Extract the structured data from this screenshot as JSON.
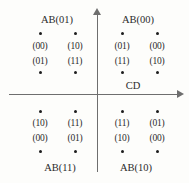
{
  "figure": {
    "type": "constellation-diagram",
    "axis_label_horizontal": "CD",
    "background_color": "#fdfdfb",
    "axis_color": "#6e6e6e",
    "point_color": "#1d1d1d"
  },
  "quadrants": [
    {
      "name": "top-left",
      "label": "AB(01)",
      "label_x": 57,
      "label_y": 14,
      "points": [
        {
          "dot_x": 40,
          "dot_y": 33,
          "upper": "(00)",
          "lower": "(01)",
          "upper_y": 41,
          "lower_y": 56
        },
        {
          "dot_x": 75,
          "dot_y": 33,
          "upper": "(10)",
          "lower": "(11)",
          "upper_y": 41,
          "lower_y": 56
        },
        {
          "dot_x": 40,
          "dot_y": 72,
          "upper": "",
          "lower": "",
          "upper_y": 0,
          "lower_y": 0
        },
        {
          "dot_x": 75,
          "dot_y": 72,
          "upper": "",
          "lower": "",
          "upper_y": 0,
          "lower_y": 0
        }
      ]
    },
    {
      "name": "top-right",
      "label": "AB(00)",
      "label_x": 138,
      "label_y": 14,
      "points": [
        {
          "dot_x": 122,
          "dot_y": 33,
          "upper": "(01)",
          "lower": "(11)",
          "upper_y": 41,
          "lower_y": 56
        },
        {
          "dot_x": 157,
          "dot_y": 33,
          "upper": "(00)",
          "lower": "(10)",
          "upper_y": 41,
          "lower_y": 56
        },
        {
          "dot_x": 122,
          "dot_y": 72,
          "upper": "",
          "lower": "",
          "upper_y": 0,
          "lower_y": 0
        },
        {
          "dot_x": 157,
          "dot_y": 72,
          "upper": "",
          "lower": "",
          "upper_y": 0,
          "lower_y": 0
        }
      ]
    },
    {
      "name": "bottom-left",
      "label": "AB(11)",
      "label_x": 60,
      "label_y": 162,
      "points": [
        {
          "dot_x": 40,
          "dot_y": 111,
          "upper": "(10)",
          "lower": "(00)",
          "upper_y": 118,
          "lower_y": 133
        },
        {
          "dot_x": 75,
          "dot_y": 111,
          "upper": "(11)",
          "lower": "(01)",
          "upper_y": 118,
          "lower_y": 133
        },
        {
          "dot_x": 40,
          "dot_y": 151,
          "upper": "",
          "lower": "",
          "upper_y": 0,
          "lower_y": 0
        },
        {
          "dot_x": 75,
          "dot_y": 151,
          "upper": "",
          "lower": "",
          "upper_y": 0,
          "lower_y": 0
        }
      ]
    },
    {
      "name": "bottom-right",
      "label": "AB(10)",
      "label_x": 136,
      "label_y": 162,
      "points": [
        {
          "dot_x": 122,
          "dot_y": 111,
          "upper": "(11)",
          "lower": "(10)",
          "upper_y": 118,
          "lower_y": 133
        },
        {
          "dot_x": 157,
          "dot_y": 111,
          "upper": "(01)",
          "lower": "(00)",
          "upper_y": 118,
          "lower_y": 133
        },
        {
          "dot_x": 122,
          "dot_y": 151,
          "upper": "",
          "lower": "",
          "upper_y": 0,
          "lower_y": 0
        },
        {
          "dot_x": 157,
          "dot_y": 151,
          "upper": "",
          "lower": "",
          "upper_y": 0,
          "lower_y": 0
        }
      ]
    }
  ],
  "cd_label": {
    "text": "CD",
    "x": 133,
    "y": 80
  },
  "chart_data": {
    "type": "scatter",
    "title": "",
    "xlabel": "CD",
    "ylabel": "",
    "grid": false,
    "legend": "none",
    "annotations": [
      "AB(01)",
      "AB(00)",
      "AB(11)",
      "AB(10)",
      "CD"
    ],
    "series": [
      {
        "name": "AB(01)",
        "quadrant": "top-left",
        "points": [
          {
            "x": -3,
            "y": 3,
            "bits": "(00)"
          },
          {
            "x": -1,
            "y": 3,
            "bits": "(10)"
          },
          {
            "x": -3,
            "y": 1,
            "bits": "(01)"
          },
          {
            "x": -1,
            "y": 1,
            "bits": "(11)"
          }
        ]
      },
      {
        "name": "AB(00)",
        "quadrant": "top-right",
        "points": [
          {
            "x": 1,
            "y": 3,
            "bits": "(01)"
          },
          {
            "x": 3,
            "y": 3,
            "bits": "(00)"
          },
          {
            "x": 1,
            "y": 1,
            "bits": "(11)"
          },
          {
            "x": 3,
            "y": 1,
            "bits": "(10)"
          }
        ]
      },
      {
        "name": "AB(11)",
        "quadrant": "bottom-left",
        "points": [
          {
            "x": -3,
            "y": -1,
            "bits": "(10)"
          },
          {
            "x": -1,
            "y": -1,
            "bits": "(11)"
          },
          {
            "x": -3,
            "y": -3,
            "bits": "(00)"
          },
          {
            "x": -1,
            "y": -3,
            "bits": "(01)"
          }
        ]
      },
      {
        "name": "AB(10)",
        "quadrant": "bottom-right",
        "points": [
          {
            "x": 1,
            "y": -1,
            "bits": "(11)"
          },
          {
            "x": 3,
            "y": -1,
            "bits": "(01)"
          },
          {
            "x": 1,
            "y": -3,
            "bits": "(10)"
          },
          {
            "x": 3,
            "y": -3,
            "bits": "(00)"
          }
        ]
      }
    ]
  }
}
